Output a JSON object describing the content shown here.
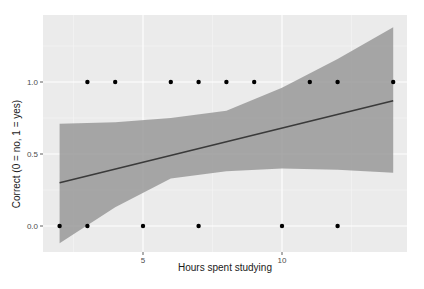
{
  "chart_data": {
    "type": "scatter",
    "title": "",
    "xlabel": "Hours spent studying",
    "ylabel": "Correct (0 = no, 1 = yes)",
    "xlim": [
      1.5,
      14.5
    ],
    "ylim": [
      -0.18,
      1.47
    ],
    "x_ticks": [
      5,
      10
    ],
    "x_tick_labels": [
      "5",
      "10"
    ],
    "y_ticks": [
      0.0,
      0.5,
      1.0
    ],
    "y_tick_labels": [
      "0.0",
      "0.5",
      "1.0"
    ],
    "grid": true,
    "legend": "none",
    "series": [
      {
        "name": "observations",
        "type": "scatter",
        "points": [
          {
            "x": 2,
            "y": 0
          },
          {
            "x": 3,
            "y": 0
          },
          {
            "x": 5,
            "y": 0
          },
          {
            "x": 7,
            "y": 0
          },
          {
            "x": 10,
            "y": 0
          },
          {
            "x": 12,
            "y": 0
          },
          {
            "x": 3,
            "y": 1
          },
          {
            "x": 4,
            "y": 1
          },
          {
            "x": 6,
            "y": 1
          },
          {
            "x": 7,
            "y": 1
          },
          {
            "x": 8,
            "y": 1
          },
          {
            "x": 9,
            "y": 1
          },
          {
            "x": 11,
            "y": 1
          },
          {
            "x": 12,
            "y": 1
          },
          {
            "x": 14,
            "y": 1
          }
        ]
      },
      {
        "name": "linear fit",
        "type": "line",
        "x": [
          2,
          14
        ],
        "y": [
          0.3,
          0.87
        ]
      },
      {
        "name": "95% confidence band",
        "type": "area",
        "x": [
          2,
          4,
          6,
          8,
          10,
          12,
          14
        ],
        "upper": [
          0.71,
          0.72,
          0.75,
          0.8,
          0.96,
          1.16,
          1.38
        ],
        "lower": [
          -0.12,
          0.13,
          0.33,
          0.38,
          0.4,
          0.39,
          0.37
        ]
      }
    ]
  }
}
